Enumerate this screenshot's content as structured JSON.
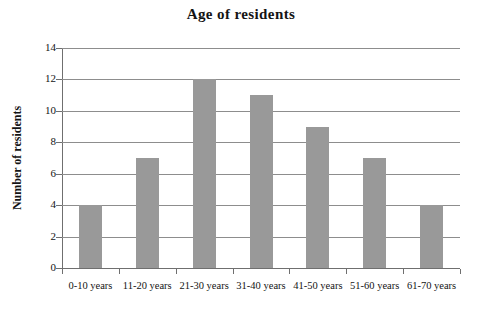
{
  "chart_data": {
    "type": "bar",
    "title": "Age of residents",
    "xlabel": "",
    "ylabel": "Number of residents",
    "categories": [
      "0-10 years",
      "11-20 years",
      "21-30 years",
      "31-40 years",
      "41-50 years",
      "51-60 years",
      "61-70 years"
    ],
    "values": [
      4,
      7,
      12,
      11,
      9,
      7,
      4
    ],
    "ylim": [
      0,
      14
    ],
    "ytick_labels": [
      "0",
      "2",
      "4",
      "6",
      "8",
      "10",
      "12",
      "14"
    ],
    "ytick_values": [
      0,
      2,
      4,
      6,
      8,
      10,
      12,
      14
    ],
    "grid": true,
    "legend": false,
    "legend_position": "none",
    "bar_color": "#999999",
    "grid_color": "#8d8d8d",
    "axis_color": "#6f6f6f",
    "text_color": "#141414",
    "background_color": "#ffffff"
  }
}
